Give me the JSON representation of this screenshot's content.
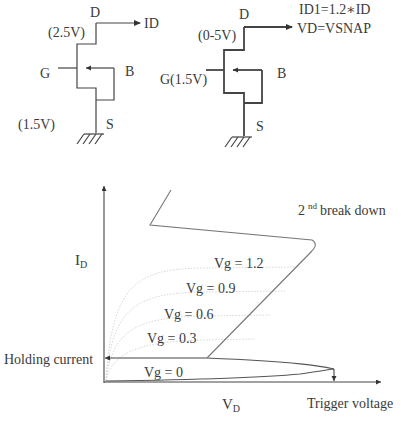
{
  "circuit_left": {
    "drain_label": "D",
    "drain_voltage": "(2.5V)",
    "output_label": "ID",
    "gate_label": "G",
    "body_label": "B",
    "gate_voltage": "(1.5V)",
    "source_label": "S"
  },
  "circuit_right": {
    "drain_label": "D",
    "drain_voltage": "(0-5V)",
    "equation_1": "ID1=1.2∗ID",
    "equation_2": "VD=VSNAP",
    "gate_label": "G(1.5V)",
    "body_label": "B",
    "source_label": "S"
  },
  "chart_data": {
    "type": "line",
    "title": "",
    "xlabel": "V",
    "xlabel_sub": "D",
    "ylabel": "I",
    "ylabel_sub": "D",
    "annotations": {
      "second_breakdown": "2",
      "second_breakdown_sup": "nd",
      "second_breakdown_text": "break down",
      "holding_current": "Holding current",
      "trigger_voltage": "Trigger voltage"
    },
    "series": [
      {
        "name": "Vg = 1.2",
        "label": "Vg = 1.2"
      },
      {
        "name": "Vg = 0.9",
        "label": "Vg = 0.9"
      },
      {
        "name": "Vg = 0.6",
        "label": "Vg = 0.6"
      },
      {
        "name": "Vg = 0.3",
        "label": "Vg = 0.3"
      },
      {
        "name": "Vg = 0",
        "label": "Vg = 0"
      }
    ]
  }
}
